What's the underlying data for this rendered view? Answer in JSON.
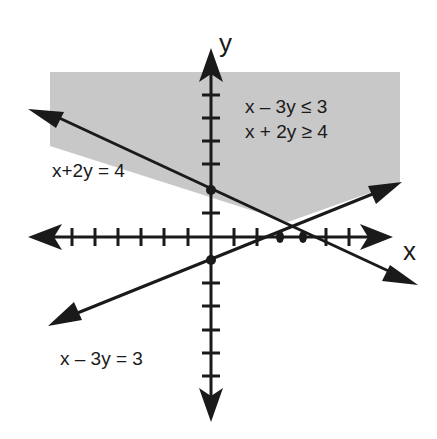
{
  "inequalities": [
    "x – 3y ≤ 3",
    "x + 2y ≥ 4"
  ],
  "lines": [
    {
      "label": "x+2y = 4",
      "equation": "x + 2y = 4",
      "x_intercept": 4,
      "y_intercept": 2
    },
    {
      "label": "x – 3y = 3",
      "equation": "x - 3y = 3",
      "x_intercept": 3,
      "y_intercept": -1
    }
  ],
  "axes": {
    "x_label": "x",
    "y_label": "y",
    "tick_spacing": 1,
    "x_range": [
      -8,
      8
    ],
    "y_range": [
      -7,
      7
    ]
  },
  "points": [
    [
      0,
      2
    ],
    [
      4,
      0
    ],
    [
      3,
      0
    ],
    [
      0,
      -1
    ]
  ],
  "shading": {
    "color": "#c8c8c8",
    "region": "x - 3y <= 3 and x + 2y >= 4"
  },
  "colors": {
    "line": "#1a1a1a",
    "shade": "#c8c8c8"
  }
}
